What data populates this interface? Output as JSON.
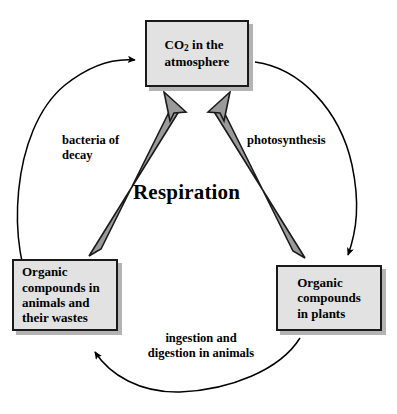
{
  "diagram": {
    "colors": {
      "box_fill": "#e2e2e2",
      "box_border": "#1a1a1a",
      "box_shadow": "#b4b4b4",
      "thick_arrow_fill": "#9a9a9a",
      "thick_arrow_border": "#1a1a1a",
      "thin_arrow": "#000000",
      "background": "#ffffff",
      "text": "#000000"
    },
    "nodes": [
      {
        "id": "co2",
        "label": "CO2 in the\natmosphere",
        "label_line1": "in the",
        "label_line2": "atmosphere",
        "formula_base": "CO",
        "formula_sub": "2",
        "position": "top"
      },
      {
        "id": "animals",
        "label": "Organic\ncompounds in\nanimals and\ntheir wastes",
        "position": "bottom-left"
      },
      {
        "id": "plants",
        "label": "Organic\ncompounds\nin plants",
        "position": "bottom-right"
      }
    ],
    "edges": [
      {
        "id": "bacteria-of-decay",
        "label": "bacteria of\ndecay",
        "from": "animals",
        "to": "co2",
        "style": "thin-curved-arc",
        "side": "left"
      },
      {
        "id": "photosynthesis",
        "label": "photosynthesis",
        "from": "co2",
        "to": "plants",
        "style": "thin-curved-arc",
        "side": "right"
      },
      {
        "id": "ingestion-digestion",
        "label": "ingestion  and\ndigestion in animals",
        "from": "plants",
        "to": "animals",
        "style": "thin-curved-arc",
        "side": "bottom"
      },
      {
        "id": "respiration-animals",
        "label": "Respiration",
        "from": "animals",
        "to": "co2",
        "style": "thick-gray-arrow"
      },
      {
        "id": "respiration-plants",
        "label": "Respiration",
        "from": "plants",
        "to": "co2",
        "style": "thick-gray-arrow"
      }
    ],
    "respiration_label": "Respiration"
  }
}
